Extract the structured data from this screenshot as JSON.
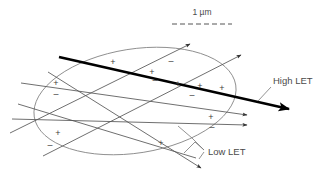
{
  "figure": {
    "title_text": "",
    "scale_bar": {
      "label": "1 µm",
      "dash_pattern": "5,3",
      "color": "#555555",
      "x1": 172,
      "x2": 232,
      "y": 24
    },
    "nucleus": {
      "name": "cell-nucleus-ellipse",
      "cx": 135,
      "cy": 101,
      "rx": 102,
      "ry": 52,
      "rotation": -9,
      "stroke": "#8a8a8a"
    },
    "labels": [
      {
        "id": "high-let",
        "text": "High LET",
        "x": 273,
        "y": 83,
        "leader": "M 270 88 L 258 101"
      },
      {
        "id": "low-let",
        "text": "Low LET",
        "x": 208,
        "y": 155,
        "leaders": [
          "M 205 151 L 192 139 L 178 127",
          "M 205 151 L 196 143 L 186 152",
          "M 205 151 L 200 158"
        ]
      }
    ],
    "tracks": {
      "high_let": {
        "name": "high-let-track",
        "label": "High LET",
        "color": "#000000",
        "width": 2.6,
        "x1": 59,
        "y1": 57,
        "x2": 293,
        "y2": 110,
        "arrow": "filled"
      },
      "low_let": [
        {
          "name": "low-let-track-1",
          "x1": 10,
          "y1": 133,
          "x2": 192,
          "y2": 43,
          "arrow": true
        },
        {
          "name": "low-let-track-2",
          "x1": 43,
          "y1": 156,
          "x2": 243,
          "y2": 54,
          "arrow": true
        },
        {
          "name": "low-let-track-3",
          "x1": 21,
          "y1": 83,
          "x2": 250,
          "y2": 115,
          "arrow": true
        },
        {
          "name": "low-let-track-4",
          "x1": 12,
          "y1": 119,
          "x2": 250,
          "y2": 125,
          "arrow": true
        },
        {
          "name": "low-let-track-5",
          "x1": 48,
          "y1": 72,
          "x2": 203,
          "y2": 170,
          "arrow": true
        },
        {
          "name": "low-let-track-6",
          "x1": 18,
          "y1": 104,
          "x2": 196,
          "y2": 158,
          "arrow": false
        }
      ]
    },
    "ionizations": [
      {
        "sign": "+",
        "x": 113,
        "y": 65
      },
      {
        "sign": "–",
        "x": 171,
        "y": 64
      },
      {
        "sign": "+",
        "x": 152,
        "y": 75
      },
      {
        "sign": "+",
        "x": 56,
        "y": 86
      },
      {
        "sign": "–",
        "x": 155,
        "y": 83
      },
      {
        "sign": "+",
        "x": 178,
        "y": 87
      },
      {
        "sign": "+",
        "x": 200,
        "y": 89
      },
      {
        "sign": "–",
        "x": 56,
        "y": 97
      },
      {
        "sign": "+",
        "x": 222,
        "y": 91
      },
      {
        "sign": "–",
        "x": 192,
        "y": 98
      },
      {
        "sign": "+",
        "x": 211,
        "y": 120
      },
      {
        "sign": "–",
        "x": 212,
        "y": 130
      },
      {
        "sign": "+",
        "x": 58,
        "y": 136
      },
      {
        "sign": "–",
        "x": 50,
        "y": 148
      },
      {
        "sign": "+",
        "x": 161,
        "y": 146
      }
    ],
    "colors": {
      "background": "#ffffff",
      "outline": "#8a8a8a",
      "thin_track": "#555555",
      "thick_track": "#000000",
      "text": "#4a4a4a"
    }
  }
}
